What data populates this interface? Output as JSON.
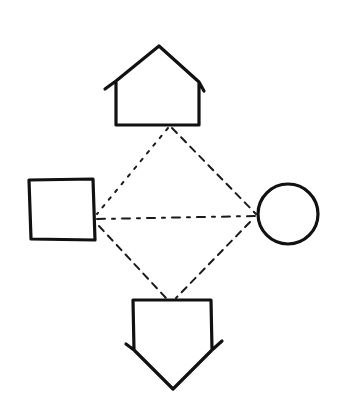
{
  "diagram": {
    "title": "",
    "background": "#ffffff",
    "stroke_color": "#111111",
    "nodes": [
      {
        "id": "house",
        "shape": "house-pentagon-up",
        "label": ""
      },
      {
        "id": "square",
        "shape": "square",
        "label": ""
      },
      {
        "id": "circle",
        "shape": "circle",
        "label": ""
      },
      {
        "id": "shield",
        "shape": "pentagon-down",
        "label": ""
      }
    ],
    "edges": [
      {
        "from": "house",
        "to": "square",
        "style": "dotted"
      },
      {
        "from": "house",
        "to": "circle",
        "style": "dashed"
      },
      {
        "from": "square",
        "to": "circle",
        "style": "dash-dot"
      },
      {
        "from": "square",
        "to": "shield",
        "style": "dashed"
      },
      {
        "from": "circle",
        "to": "shield",
        "style": "dashed"
      }
    ]
  }
}
